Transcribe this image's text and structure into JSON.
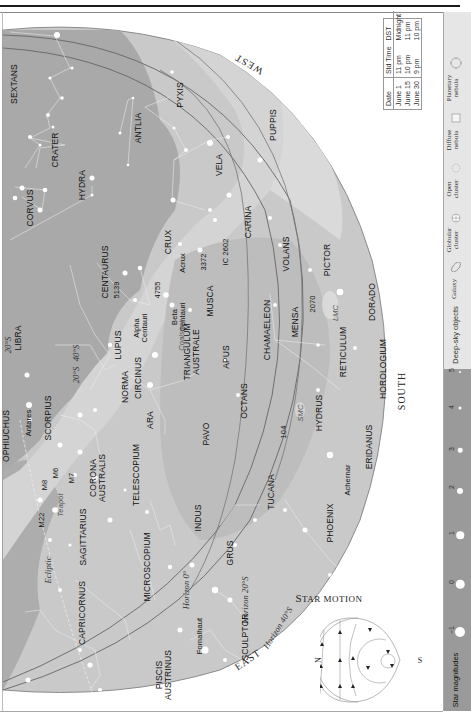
{
  "chart": {
    "orientation": "rotated-90-ccw",
    "directions": {
      "west": "WEST",
      "south": "SOUTH",
      "east": "EAST"
    },
    "horizons": [
      "Horizon 0°",
      "Horizon 20°S",
      "Horizon 40°S"
    ],
    "declination_labels": [
      "20°S",
      "40°S",
      "20°S"
    ],
    "ecliptic_label": "Ecliptic",
    "constellations": [
      "SEXTANS",
      "CRATER",
      "CORVUS",
      "HYDRA",
      "ANTLIA",
      "PYXIS",
      "PUPPIS",
      "VELA",
      "CARINA",
      "CENTAURUS",
      "CRUX",
      "MUSCA",
      "VOLANS",
      "PICTOR",
      "LIBRA",
      "LUPUS",
      "CIRCINUS",
      "TRIANGULUM AUSTRALE",
      "CHAMAELEON",
      "MENSA",
      "DORADO",
      "OPHIUCHUS",
      "SCORPIUS",
      "NORMA",
      "APUS",
      "OCTANS",
      "HYDRUS",
      "RETICULUM",
      "HOROLOGIUM",
      "ARA",
      "PAVO",
      "TELESCOPIUM",
      "CORONA AUSTRALIS",
      "SAGITTARIUS",
      "INDUS",
      "TUCANA",
      "ERIDANUS",
      "MICROSCOPIUM",
      "GRUS",
      "PHOENIX",
      "CAPRICORNUS",
      "PISCIS AUSTRINUS",
      "SCULPTOR"
    ],
    "stars": [
      "Canopus",
      "Alpha Centauri",
      "Beta Centauri",
      "Acrux",
      "Antares",
      "Achernar",
      "Fomalhaut"
    ],
    "deep_sky": [
      "5139",
      "4755",
      "3372",
      "IC 2602",
      "2070",
      "104",
      "M6",
      "M7",
      "M8",
      "M22",
      "Coalsack",
      "LMC",
      "SMC",
      "Teapot"
    ]
  },
  "labels": {
    "sextans": "SEXTANS",
    "crater": "CRATER",
    "corvus": "CORVUS",
    "hydra": "HYDRA",
    "antlia": "ANTLIA",
    "pyxis": "PYXIS",
    "puppis": "PUPPIS",
    "vela": "VELA",
    "carina": "CARINA",
    "centaurus": "CENTAURUS",
    "crux": "CRUX",
    "musca": "MUSCA",
    "volans": "VOLANS",
    "pictor": "PICTOR",
    "libra": "LIBRA",
    "lupus": "LUPUS",
    "circinus": "CIRCINUS",
    "tri_aus_1": "TRIANGULUM",
    "tri_aus_2": "AUSTRALE",
    "chamaeleon": "CHAMAELEON",
    "mensa": "MENSA",
    "dorado": "DORADO",
    "ophiuchus": "OPHIUCHUS",
    "scorpius": "SCORPIUS",
    "norma": "NORMA",
    "apus": "APUS",
    "octans": "OCTANS",
    "hydrus": "HYDRUS",
    "reticulum": "RETICULUM",
    "horologium": "HOROLOGIUM",
    "ara": "ARA",
    "pavo": "PAVO",
    "telescopium": "TELESCOPIUM",
    "cor_aus_1": "CORONA",
    "cor_aus_2": "AUSTRALIS",
    "sagittarius": "SAGITTARIUS",
    "indus": "INDUS",
    "tucana": "TUCANA",
    "eridanus": "ERIDANUS",
    "microscopium": "MICROSCOPIUM",
    "grus": "GRUS",
    "phoenix": "PHOENIX",
    "capricornus": "CAPRICORNUS",
    "psa_1": "PISCIS",
    "psa_2": "AUSTRINUS",
    "sculptor": "SCULPTOR",
    "canopus": "Canopus",
    "alpha_cen_1": "Alpha",
    "alpha_cen_2": "Centauri",
    "beta_cen_1": "Beta",
    "beta_cen_2": "Centauri",
    "acrux": "Acrux",
    "antares": "Antares",
    "achernar": "Achernar",
    "fomalhaut": "Fomalhaut",
    "ngc5139": "5139",
    "ngc4755": "4755",
    "ngc3372": "3372",
    "ic2602": "IC 2602",
    "ngc2070": "2070",
    "ngc104": "104",
    "m6": "M6",
    "m7": "M7",
    "m8": "M8",
    "m22": "M22",
    "coalsack": "Coalsack",
    "lmc": "LMC",
    "smc": "SMC",
    "teapot": "Teapot",
    "west": "WEST",
    "south": "SOUTH",
    "east": "EAST",
    "horizon0": "Horizon 0°",
    "horizon20": "Horizon 20°S",
    "horizon40": "Horizon 40°S",
    "dec20_a": "20°S",
    "dec40": "40°S",
    "dec20_b": "20°S",
    "ecliptic": "Ecliptic"
  },
  "time_table": {
    "headers": [
      "Date",
      "Std Time",
      "DST"
    ],
    "rows": [
      [
        "June 1",
        "11 pm",
        "Midnight"
      ],
      [
        "June 15",
        "10 pm",
        "11 pm"
      ],
      [
        "June 30",
        "9 pm",
        "10 pm"
      ]
    ]
  },
  "legend": {
    "deep_sky_title": "Deep-sky objects",
    "deep_sky_items": [
      {
        "label": "Galaxy",
        "icon": "galaxy-ellipse-icon"
      },
      {
        "label1": "Globular",
        "label2": "cluster",
        "icon": "globular-cluster-icon"
      },
      {
        "label1": "Open",
        "label2": "cluster",
        "icon": "open-cluster-icon"
      },
      {
        "label1": "Diffuse",
        "label2": "nebula",
        "icon": "diffuse-nebula-icon"
      },
      {
        "label1": "Planetary",
        "label2": "nebula",
        "icon": "planetary-nebula-icon"
      }
    ],
    "magnitude_title": "Star magnitudes",
    "magnitudes": [
      "−1",
      "0",
      "1",
      "2",
      "3",
      "4",
      "5"
    ]
  },
  "star_motion": {
    "title_first": "S",
    "title_rest": "TAR MOTION",
    "north": "N",
    "south": "S"
  },
  "colors": {
    "sky_outer": "#cfcfcf",
    "sky_mid": "#b8b8b8",
    "milky_way": "#d6d6d6",
    "sky_inner": "#a6a6a6",
    "legend_dso": "#e6e6e6",
    "legend_mag": "#9a9a9a"
  }
}
